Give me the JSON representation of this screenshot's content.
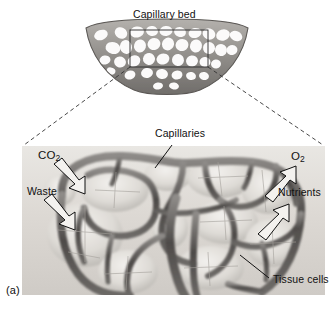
{
  "figure": {
    "panel_letter": "(a)",
    "title": "Capillary bed",
    "background_color": "#ffffff",
    "ink_color": "#111111",
    "vessel_color": "#5d5d5d",
    "tissue_color": "#d6d3ce"
  },
  "overview": {
    "name": "capillary-bed-overview",
    "title": "Capillary bed",
    "shape": "crescent mesh network",
    "selection_box": {
      "x": 130,
      "y": 30,
      "width": 78,
      "height": 37
    }
  },
  "detail": {
    "name": "capillary-network-detail",
    "labels": {
      "capillaries": "Capillaries",
      "tissue_cells": "Tissue cells"
    },
    "inflow": [
      {
        "id": "co2",
        "text": "CO",
        "subscript": "2",
        "direction": "down-right"
      },
      {
        "id": "waste",
        "text": "Waste",
        "subscript": "",
        "direction": "down-right"
      }
    ],
    "outflow": [
      {
        "id": "o2",
        "text": "O",
        "subscript": "2",
        "direction": "up-right"
      },
      {
        "id": "nutrients",
        "text": "Nutrients",
        "subscript": "",
        "direction": "up-right"
      }
    ]
  }
}
